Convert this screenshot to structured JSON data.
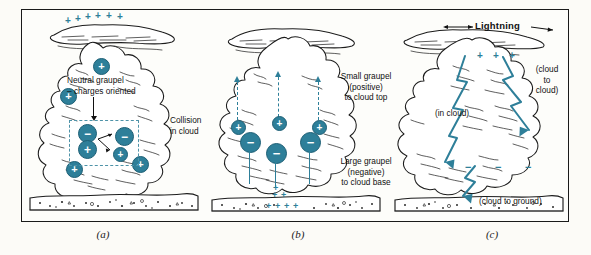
{
  "figure": {
    "accent_color": "#2e7f99",
    "ink_color": "#1a1a1a",
    "background_color": "#fcfbf7"
  },
  "panels": [
    {
      "id": "a",
      "label": "(a)",
      "annotations": [
        {
          "name": "neutral-graupel-label",
          "text": "Neutral graupel\n– charges oriented"
        },
        {
          "name": "collision-in-cloud-label",
          "text": "Collision\nin cloud"
        }
      ],
      "charges": [
        {
          "name": "charge-upper-cloud",
          "sign": "+"
        },
        {
          "name": "charge-mid-left-cloud",
          "sign": "+"
        },
        {
          "name": "charge-graupel-top",
          "sign": "−"
        },
        {
          "name": "charge-graupel-bottom",
          "sign": "+"
        },
        {
          "name": "charge-collision-negative",
          "sign": "−"
        },
        {
          "name": "charge-collision-positive",
          "sign": "+"
        },
        {
          "name": "charge-lower-left-cloud",
          "sign": "+"
        },
        {
          "name": "charge-lower-right-cloud",
          "sign": "+"
        }
      ],
      "anvil_signs": [
        "+",
        "+",
        "+",
        "+",
        "+",
        "+"
      ]
    },
    {
      "id": "b",
      "label": "(b)",
      "annotations": [
        {
          "name": "small-graupel-label",
          "text": "Small graupel\n(positive)\nto cloud top"
        },
        {
          "name": "large-graupel-label",
          "text": "Large graupel\n(negative)\nto cloud base"
        }
      ],
      "charges": [
        {
          "name": "small-graupel-positive-1",
          "sign": "+"
        },
        {
          "name": "small-graupel-positive-2",
          "sign": "+"
        },
        {
          "name": "small-graupel-positive-3",
          "sign": "+"
        },
        {
          "name": "large-graupel-negative-1",
          "sign": "−"
        },
        {
          "name": "large-graupel-negative-2",
          "sign": "−"
        },
        {
          "name": "large-graupel-negative-3",
          "sign": "−"
        }
      ],
      "cloud_base_signs": [
        "+",
        "+",
        "+"
      ],
      "ground_signs": [
        "+",
        "+",
        "+",
        "+"
      ]
    },
    {
      "id": "c",
      "label": "(c)",
      "annotations": [
        {
          "name": "lightning-title",
          "text": "Lightning"
        },
        {
          "name": "cloud-to-cloud-label",
          "text": "(cloud\nto\ncloud)"
        },
        {
          "name": "in-cloud-label",
          "text": "(in cloud)"
        },
        {
          "name": "cloud-to-ground-label",
          "text": "(cloud to ground)"
        }
      ],
      "anvil_signs": [
        "+",
        "+",
        "+"
      ],
      "cloud_base_signs": [
        "−",
        "−",
        "−"
      ]
    }
  ]
}
